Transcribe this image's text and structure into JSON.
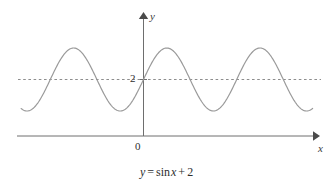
{
  "figure": {
    "background_color": "#ffffff",
    "width": 333,
    "height": 190,
    "caption_parts": {
      "lhs": "y",
      "equals": "=",
      "func": "sin",
      "var": "x",
      "plus": "+",
      "const": "2"
    },
    "caption_full": "y = sin x + 2"
  },
  "axes": {
    "y_axis_label": "y",
    "x_axis_label": "x",
    "origin_label": "0",
    "midline_tick_label": "2",
    "axis_color": "#6e6e6e",
    "curve_color": "#9a9a9a",
    "dash_color": "#8d8d8d"
  },
  "chart_data": {
    "type": "line",
    "title": "",
    "xlabel": "x",
    "ylabel": "y",
    "expression": "y = sin x + 2",
    "grid": false,
    "legend": null,
    "annotations": [
      {
        "text": "2",
        "kind": "y-tick",
        "value": 2
      },
      {
        "text": "0",
        "kind": "origin",
        "value": 0
      }
    ],
    "reference_lines": [
      {
        "orientation": "horizontal",
        "y": 2,
        "style": "dashed",
        "label": "2"
      }
    ],
    "series": [
      {
        "name": "y = sin x + 2",
        "amplitude": 1,
        "vertical_shift": 2,
        "period_radians": 6.283185307179586,
        "x_domain_radians": [
          -8.25,
          11.4
        ],
        "y_range": [
          1,
          3
        ],
        "x": [
          -8.25,
          -7.75,
          -7.25,
          -6.75,
          -6.25,
          -5.75,
          -5.25,
          -4.75,
          -4.25,
          -3.75,
          -3.25,
          -2.75,
          -2.25,
          -1.75,
          -1.25,
          -0.75,
          -0.25,
          0.25,
          0.75,
          1.25,
          1.75,
          2.25,
          2.75,
          3.25,
          3.75,
          4.25,
          4.75,
          5.25,
          5.75,
          6.25,
          6.75,
          7.25,
          7.75,
          8.25,
          8.75,
          9.25,
          9.75,
          10.25,
          10.75,
          11.4
        ],
        "y": [
          2.9,
          2.99,
          2.84,
          2.48,
          2.03,
          1.6,
          1.25,
          1.03,
          1.1,
          1.43,
          1.89,
          2.38,
          2.78,
          2.98,
          2.95,
          2.68,
          2.25,
          2.25,
          2.68,
          2.95,
          2.98,
          2.78,
          2.38,
          1.89,
          1.43,
          1.1,
          1.03,
          1.25,
          1.6,
          2.03,
          2.48,
          2.84,
          2.99,
          2.9,
          2.6,
          2.18,
          1.73,
          1.36,
          1.1,
          1.01
        ]
      }
    ],
    "x_axis": {
      "arrow": true,
      "ticks": [],
      "ticklabels": []
    },
    "y_axis": {
      "arrow": true,
      "ticks": [
        2
      ],
      "ticklabels": [
        "2"
      ]
    }
  }
}
